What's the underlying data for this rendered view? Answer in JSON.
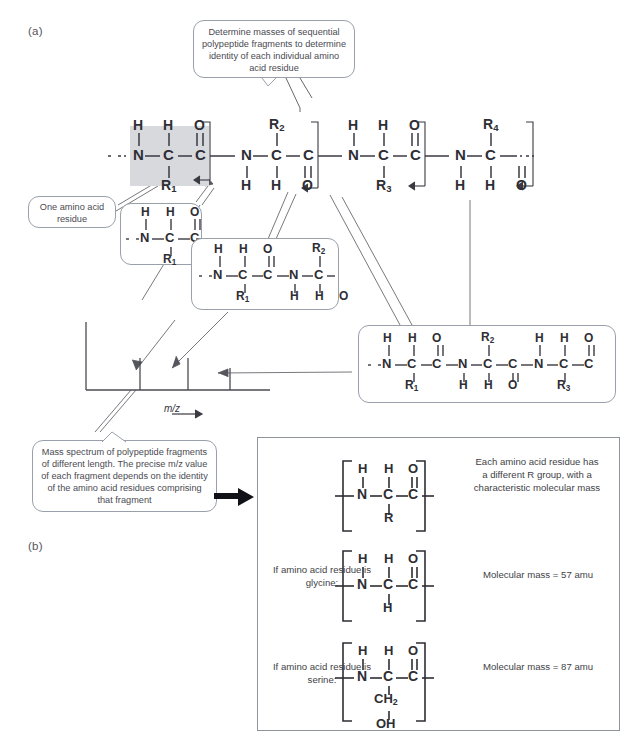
{
  "figure": {
    "panel_a_label": "(a)",
    "panel_b_label": "(b)",
    "caption": ""
  },
  "callouts": {
    "determine_masses": "Determine masses of sequential polypeptide fragments to determine identity of each individual amino acid residue",
    "one_residue": "One amino acid residue",
    "mass_spectrum": "Mass spectrum of polypeptide fragments of different length. The precise m/z value of each fragment depends on the identity of the amino acid residues comprising that fragment"
  },
  "spectrum": {
    "axis_label": "m/z",
    "peaks": [
      {
        "x": 0.3,
        "height": 0.46
      },
      {
        "x": 0.56,
        "height": 0.46
      },
      {
        "x": 0.79,
        "height": 0.3
      }
    ]
  },
  "chain": {
    "residues": [
      {
        "n_h": "H",
        "c_h": "H",
        "carbonyl": "O",
        "r": "R",
        "r_sub": "1",
        "r_pos": "bottom",
        "nh_pos": "top",
        "ch_pos": "top"
      },
      {
        "n_h": "H",
        "c_h": "H",
        "carbonyl": "O",
        "r": "R",
        "r_sub": "2",
        "r_pos": "top",
        "nh_pos": "bottom",
        "ch_pos": "bottom"
      },
      {
        "n_h": "H",
        "c_h": "H",
        "carbonyl": "O",
        "r": "R",
        "r_sub": "3",
        "r_pos": "bottom",
        "nh_pos": "top",
        "ch_pos": "top"
      },
      {
        "n_h": "H",
        "c_h": "H",
        "carbonyl": "O",
        "r": "R",
        "r_sub": "4",
        "r_pos": "top",
        "nh_pos": "bottom",
        "ch_pos": "bottom"
      }
    ],
    "atoms": {
      "n": "N",
      "c": "C",
      "o": "O",
      "h": "H"
    }
  },
  "fragments": {
    "frag1_label": "fragment of one residue",
    "frag2_label": "fragment of two residues",
    "frag3_label": "fragment of three residues"
  },
  "panel_b": {
    "generic": {
      "right_text": "Each amino acid residue has a different R group, with a characteristic molecular mass",
      "side_chain": "R"
    },
    "glycine": {
      "left_text": "If amino acid residue is glycine:",
      "side_chain": "H",
      "right_text": "Molecular mass = 57 amu"
    },
    "serine": {
      "left_text": "If amino acid residue is serine:",
      "side_chain_1": "CH",
      "side_chain_1_sub": "2",
      "side_chain_2": "OH",
      "right_text": "Molecular mass = 87 amu"
    }
  }
}
